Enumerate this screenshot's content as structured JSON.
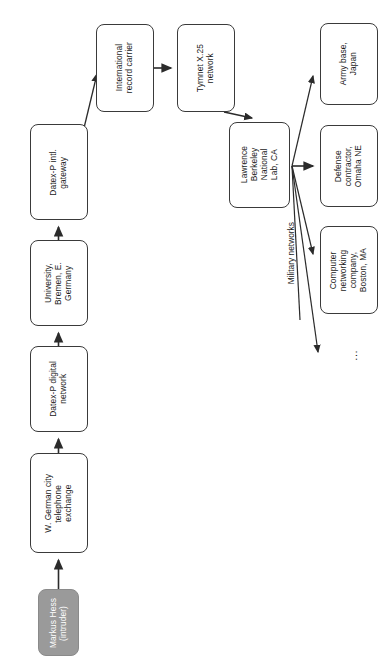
{
  "diagram": {
    "orientation": "rotated-90-ccw",
    "nodes": [
      {
        "id": "markus-hess",
        "label": "Markus Hess\n(intruder)",
        "style": "shaded",
        "fill": "#9a9a9a",
        "text_color": "#ffffff",
        "x": 38,
        "y": 589,
        "w": 41,
        "h": 67
      },
      {
        "id": "telephone-exchange",
        "label": "W. German city\ntelephone\nexchange",
        "style": "plain",
        "fill": "#ffffff",
        "text_color": "#1a1a1a",
        "x": 30,
        "y": 453,
        "w": 58,
        "h": 100
      },
      {
        "id": "datex-p-digital-network",
        "label": "Datex-P digital\nnetwork",
        "style": "plain",
        "fill": "#ffffff",
        "text_color": "#1a1a1a",
        "x": 30,
        "y": 346,
        "w": 58,
        "h": 86
      },
      {
        "id": "university-bremen",
        "label": "University,\nBremen, E.\nGermany",
        "style": "plain",
        "fill": "#ffffff",
        "text_color": "#1a1a1a",
        "x": 30,
        "y": 240,
        "w": 58,
        "h": 86
      },
      {
        "id": "datex-p-intl-gateway",
        "label": "Datex-P intl.\ngateway",
        "style": "plain",
        "fill": "#ffffff",
        "text_color": "#1a1a1a",
        "x": 30,
        "y": 124,
        "w": 58,
        "h": 96
      },
      {
        "id": "international-record-carrier",
        "label": "International\nrecord carrier",
        "style": "plain",
        "fill": "#ffffff",
        "text_color": "#1a1a1a",
        "x": 96,
        "y": 24,
        "w": 58,
        "h": 88
      },
      {
        "id": "tymnet-x25-network",
        "label": "Tymnet X.25\nnetwork",
        "style": "plain",
        "fill": "#ffffff",
        "text_color": "#1a1a1a",
        "x": 177,
        "y": 24,
        "w": 58,
        "h": 88
      },
      {
        "id": "lawrence-berkeley-lab",
        "label": "Lawrence\nBerkeley\nNational\nLab, CA",
        "style": "plain",
        "fill": "#ffffff",
        "text_color": "#1a1a1a",
        "x": 229,
        "y": 122,
        "w": 61,
        "h": 86
      },
      {
        "id": "army-base-japan",
        "label": "Army base,\nJapan",
        "style": "plain",
        "fill": "#ffffff",
        "text_color": "#1a1a1a",
        "x": 320,
        "y": 23,
        "w": 58,
        "h": 82
      },
      {
        "id": "defense-contractor-omaha",
        "label": "Defense\ncontractor,\nOmaha NE",
        "style": "plain",
        "fill": "#ffffff",
        "text_color": "#1a1a1a",
        "x": 320,
        "y": 125,
        "w": 58,
        "h": 82
      },
      {
        "id": "computer-networking-boston",
        "label": "Computer\nnetworking\ncompany,\nBoston, MA",
        "style": "plain",
        "fill": "#ffffff",
        "text_color": "#1a1a1a",
        "x": 320,
        "y": 226,
        "w": 58,
        "h": 88
      }
    ],
    "edge_labels": [
      {
        "id": "military-networks",
        "text": "Military networks",
        "x": 286,
        "y": 222
      }
    ],
    "ellipsis": {
      "id": "more-targets",
      "text": "...",
      "x": 347,
      "y": 350
    },
    "edges": [
      {
        "from": "markus-hess",
        "to": "telephone-exchange"
      },
      {
        "from": "telephone-exchange",
        "to": "datex-p-digital-network"
      },
      {
        "from": "datex-p-digital-network",
        "to": "university-bremen"
      },
      {
        "from": "university-bremen",
        "to": "datex-p-intl-gateway"
      },
      {
        "from": "datex-p-intl-gateway",
        "to": "international-record-carrier"
      },
      {
        "from": "international-record-carrier",
        "to": "tymnet-x25-network"
      },
      {
        "from": "tymnet-x25-network",
        "to": "lawrence-berkeley-lab"
      },
      {
        "from": "lawrence-berkeley-lab",
        "to": "army-base-japan"
      },
      {
        "from": "lawrence-berkeley-lab",
        "to": "defense-contractor-omaha"
      },
      {
        "from": "lawrence-berkeley-lab",
        "to": "computer-networking-boston"
      },
      {
        "from": "lawrence-berkeley-lab",
        "to": "more-targets"
      }
    ],
    "colors": {
      "stroke": "#3a3a3a",
      "node_fill": "#ffffff",
      "shaded_fill": "#9a9a9a",
      "text": "#1a1a1a"
    }
  }
}
